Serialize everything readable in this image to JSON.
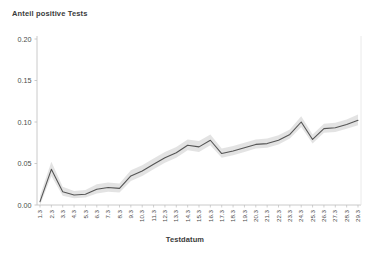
{
  "chart_data": {
    "type": "line",
    "title": "Anteil positive Tests",
    "xlabel": "Testdatum",
    "ylabel": "",
    "ylim": [
      0,
      0.2
    ],
    "grid": false,
    "legend": "none",
    "ytick_labels": [
      "0.00",
      "0.05",
      "0.10",
      "0.15",
      "0.20"
    ],
    "ytick_values": [
      0,
      0.05,
      0.1,
      0.15,
      0.2
    ],
    "categories": [
      "1.3",
      "2.3",
      "3.3",
      "4.3",
      "5.3",
      "6.3",
      "7.3",
      "8.3",
      "9.3",
      "10.3",
      "11.3",
      "12.3",
      "13.3",
      "14.3",
      "15.3",
      "16.3",
      "17.3",
      "18.3",
      "19.3",
      "20.3",
      "21.3",
      "22.3",
      "23.3",
      "24.3",
      "25.3",
      "26.3",
      "27.3",
      "28.3",
      "29.3"
    ],
    "series": [
      {
        "name": "Anteil positive Tests",
        "color": "#555555",
        "values": [
          0.004,
          0.043,
          0.016,
          0.012,
          0.013,
          0.019,
          0.021,
          0.02,
          0.035,
          0.041,
          0.049,
          0.057,
          0.063,
          0.072,
          0.07,
          0.078,
          0.062,
          0.065,
          0.069,
          0.073,
          0.074,
          0.078,
          0.085,
          0.1,
          0.079,
          0.092,
          0.093,
          0.097,
          0.102
        ]
      }
    ],
    "confidence_band": {
      "name": "Unsicherheitsband",
      "color": "#d9d9d9",
      "lower": [
        0.0,
        0.035,
        0.011,
        0.008,
        0.009,
        0.014,
        0.016,
        0.015,
        0.029,
        0.035,
        0.043,
        0.051,
        0.057,
        0.066,
        0.064,
        0.072,
        0.057,
        0.06,
        0.064,
        0.068,
        0.069,
        0.073,
        0.08,
        0.094,
        0.074,
        0.087,
        0.088,
        0.092,
        0.096
      ],
      "upper": [
        0.011,
        0.052,
        0.022,
        0.017,
        0.018,
        0.025,
        0.027,
        0.026,
        0.042,
        0.048,
        0.056,
        0.064,
        0.07,
        0.079,
        0.077,
        0.085,
        0.068,
        0.071,
        0.075,
        0.079,
        0.08,
        0.084,
        0.091,
        0.107,
        0.085,
        0.098,
        0.099,
        0.103,
        0.109
      ]
    }
  }
}
